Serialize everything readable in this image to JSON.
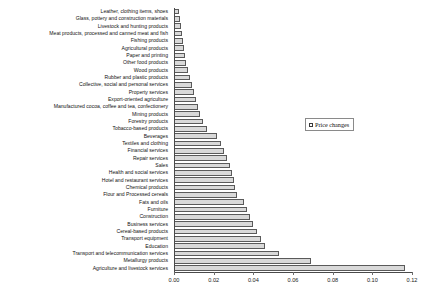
{
  "chart_data": {
    "type": "bar",
    "orientation": "horizontal",
    "title": "",
    "xlabel": "",
    "ylabel": "",
    "xlim": [
      0.0,
      0.12
    ],
    "xticks": [
      "0.00",
      "0.02",
      "0.04",
      "0.06",
      "0.08",
      "0.10",
      "0.12"
    ],
    "xtick_values": [
      0.0,
      0.02,
      0.04,
      0.06,
      0.08,
      0.1,
      0.12
    ],
    "grid": false,
    "legend": {
      "position": "upper-right-inside",
      "entries": [
        {
          "label": "Price changes",
          "marker": "square-outline",
          "color": "#d9d9d9"
        }
      ]
    },
    "bar_color": "#d9d9d9",
    "bar_edge_color": "#5a5a5a",
    "categories": [
      "Leather, clothing items, shoes",
      "Glass, pottery and construction materials",
      "Livestock and hunting products",
      "Meat products, processed and canned meat and fish",
      "Fishing products",
      "Agricultural products",
      "Paper and printing",
      "Other food products",
      "Wood products",
      "Rubber and plastic products",
      "Collective, social and personal services",
      "Property services",
      "Export-oriented agriculture",
      "Manufactured cocoa, coffee and tea, confectionery",
      "Mining products",
      "Forestry products",
      "Tobacco-based products",
      "Beverages",
      "Textiles and clothing",
      "Financial services",
      "Repair services",
      "Sales",
      "Health and social services",
      "Hotel and restaurant services",
      "Chemical products",
      "Flour and Processed cereals",
      "Fats and oils",
      "Furniture",
      "Construction",
      "Business services",
      "Cereal-based products",
      "Transport equipment",
      "Education",
      "Transport and telecommunication services",
      "Metallurgy products",
      "Agriculture and livestock services"
    ],
    "values": [
      0.0025,
      0.003,
      0.0035,
      0.004,
      0.0045,
      0.005,
      0.0055,
      0.006,
      0.007,
      0.008,
      0.009,
      0.01,
      0.011,
      0.012,
      0.013,
      0.0145,
      0.0165,
      0.0215,
      0.0235,
      0.025,
      0.0265,
      0.028,
      0.029,
      0.03,
      0.031,
      0.032,
      0.0355,
      0.037,
      0.0385,
      0.04,
      0.042,
      0.044,
      0.046,
      0.053,
      0.069,
      0.1165
    ]
  }
}
